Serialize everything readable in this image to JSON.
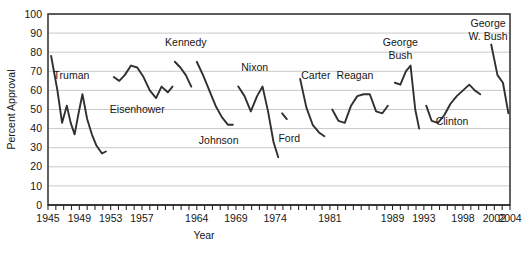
{
  "chart_data": {
    "type": "line",
    "title": "",
    "xlabel": "Year",
    "ylabel": "Percent Approval",
    "xlim": [
      1945,
      2004
    ],
    "ylim": [
      0,
      100
    ],
    "grid": true,
    "legend_position": "inline-labels",
    "y_ticks": [
      0,
      10,
      20,
      30,
      40,
      50,
      60,
      70,
      80,
      90,
      100
    ],
    "y_tick_labels": [
      "0",
      "10",
      "20",
      "30",
      "40",
      "50",
      "60",
      "70",
      "80",
      "90",
      "100"
    ],
    "x_tick_labels": [
      "1945",
      "1949",
      "1953",
      "1957",
      "1964",
      "1969",
      "1974",
      "1981",
      "1989",
      "1993",
      "1998",
      "2002",
      "2004"
    ],
    "x_tick_label_values": [
      1945,
      1949,
      1953,
      1957,
      1964,
      1969,
      1974,
      1981,
      1989,
      1993,
      1998,
      2002,
      2004
    ],
    "x_minor_tick_step": 1,
    "series": [
      {
        "name": "Truman",
        "label": "Truman",
        "label_x": 1948.0,
        "label_y": 66,
        "x": [
          1945.4,
          1946.2,
          1946.8,
          1947.4,
          1947.9,
          1948.4,
          1948.9,
          1949.4,
          1950.0,
          1950.6,
          1951.2,
          1951.9,
          1952.4
        ],
        "y": [
          78,
          60,
          43,
          52,
          43,
          37,
          48,
          58,
          45,
          37,
          31,
          27,
          28
        ]
      },
      {
        "name": "Eisenhower",
        "label": "Eisenhower",
        "label_x": 1956.4,
        "label_y": 48,
        "x": [
          1953.4,
          1954.1,
          1954.8,
          1955.6,
          1956.4,
          1957.2,
          1958.0,
          1958.8,
          1959.5,
          1960.3,
          1960.9
        ],
        "y": [
          67,
          65,
          68,
          73,
          72,
          67,
          60,
          56,
          62,
          59,
          62
        ]
      },
      {
        "name": "Kennedy",
        "label": "Kennedy",
        "label_x": 1962.6,
        "label_y": 83,
        "x": [
          1961.2,
          1961.9,
          1962.6,
          1963.3
        ],
        "y": [
          75,
          72,
          68,
          62
        ]
      },
      {
        "name": "Johnson",
        "label": "Johnson",
        "label_x": 1966.8,
        "label_y": 32,
        "x": [
          1964.0,
          1964.8,
          1965.6,
          1966.4,
          1967.2,
          1968.0,
          1968.6
        ],
        "y": [
          75,
          68,
          60,
          52,
          46,
          42,
          42
        ]
      },
      {
        "name": "Nixon",
        "label": "Nixon",
        "label_x": 1971.4,
        "label_y": 70,
        "x": [
          1969.3,
          1970.1,
          1970.9,
          1971.7,
          1972.4,
          1973.1,
          1973.8,
          1974.4
        ],
        "y": [
          62,
          57,
          49,
          57,
          62,
          49,
          33,
          25
        ]
      },
      {
        "name": "Ford",
        "label": "Ford",
        "label_x": 1975.8,
        "label_y": 33,
        "x": [
          1974.9,
          1975.5
        ],
        "y": [
          48,
          45
        ]
      },
      {
        "name": "Carter",
        "label": "Carter",
        "label_x": 1979.2,
        "label_y": 66,
        "x": [
          1977.2,
          1978.0,
          1978.8,
          1979.6,
          1980.3
        ],
        "y": [
          66,
          51,
          42,
          38,
          36
        ]
      },
      {
        "name": "Reagan",
        "label": "Reagan",
        "label_x": 1984.2,
        "label_y": 66,
        "x": [
          1981.3,
          1982.1,
          1982.9,
          1983.7,
          1984.5,
          1985.3,
          1986.1,
          1986.9,
          1987.7,
          1988.4
        ],
        "y": [
          50,
          44,
          43,
          52,
          57,
          58,
          58,
          49,
          48,
          52
        ]
      },
      {
        "name": "George Bush",
        "label": "George Bush",
        "label_line1": "George",
        "label_line2": "Bush",
        "label_x": 1990.0,
        "label_y": 83,
        "x": [
          1989.3,
          1990.0,
          1990.7,
          1991.3,
          1991.9,
          1992.4
        ],
        "y": [
          64,
          63,
          70,
          73,
          50,
          40
        ]
      },
      {
        "name": "Clinton",
        "label": "Clinton",
        "label_x": 1996.6,
        "label_y": 42,
        "x": [
          1993.3,
          1994.0,
          1994.8,
          1995.6,
          1996.4,
          1997.2,
          1998.0,
          1998.8,
          1999.5,
          2000.2
        ],
        "y": [
          52,
          44,
          43,
          47,
          53,
          57,
          60,
          63,
          60,
          58
        ]
      },
      {
        "name": "George W. Bush",
        "label": "George W. Bush",
        "label_line1": "George",
        "label_line2": "W. Bush",
        "label_x": 2001.2,
        "label_y": 93,
        "x": [
          2001.6,
          2002.4,
          2003.1,
          2003.8
        ],
        "y": [
          84,
          68,
          64,
          48
        ]
      }
    ]
  }
}
